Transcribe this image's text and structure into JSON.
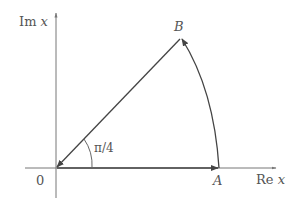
{
  "diagram": {
    "axes": {
      "vertical_label_prefix": "Im",
      "vertical_label_var": "x",
      "horizontal_label_prefix": "Re",
      "horizontal_label_var": "x"
    },
    "points": {
      "origin": "0",
      "A": "A",
      "B": "B"
    },
    "angle_label": "π/4",
    "colors": {
      "axis": "#777777",
      "path": "#444444",
      "text": "#555555"
    }
  }
}
